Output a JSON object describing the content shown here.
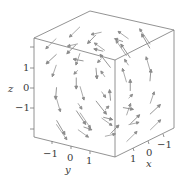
{
  "chart_data": {
    "type": "vector_field_3d",
    "title": "",
    "field": "F(x,y,z) ≈ (0, -z, y) scaled; arrows circulate counterclockwise when viewed from the positive x side",
    "axes": {
      "x": {
        "label": "x",
        "ticks": [
          "1",
          "0",
          "−1"
        ],
        "range": [
          -1.5,
          1.5
        ]
      },
      "y": {
        "label": "y",
        "ticks": [
          "−1",
          "0",
          "1"
        ],
        "range": [
          -1.5,
          1.5
        ]
      },
      "z": {
        "label": "z",
        "ticks": [
          "1",
          "0",
          "−1"
        ],
        "range": [
          -1.5,
          1.5
        ]
      }
    },
    "grid": false,
    "box": true,
    "legend": null,
    "colors": {
      "frame": "#777777",
      "arrows": "#8a8a8a",
      "text": "#3a3a3a"
    }
  },
  "labels": {
    "z_axis": "z",
    "z_ticks": [
      "1",
      "0",
      "−1"
    ],
    "y_axis": "y",
    "y_ticks": [
      "−1",
      "0",
      "1"
    ],
    "x_axis": "x",
    "x_ticks": [
      "1",
      "0",
      "−1"
    ]
  }
}
